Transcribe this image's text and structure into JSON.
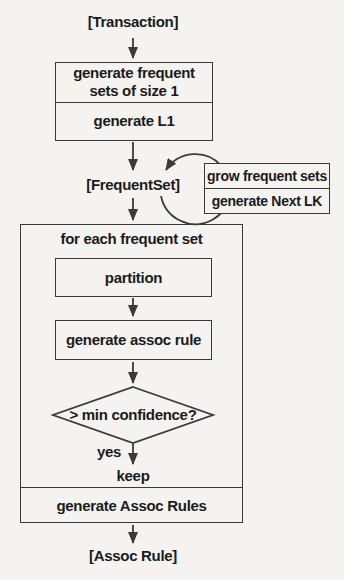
{
  "colors": {
    "background": "#f4f3f0",
    "ink": "#3a3a3a",
    "text": "#1b1b1b"
  },
  "nodes": {
    "transaction_label": "[Transaction]",
    "step1": {
      "line1": "generate frequent",
      "line2": "sets of size 1",
      "row2": "generate L1"
    },
    "frequentset_label": "[FrequentSet]",
    "loop_box": {
      "row1": "grow frequent sets",
      "row2": "generate Next LK"
    },
    "foreach": {
      "header": "for each frequent set",
      "footer": "generate Assoc Rules"
    },
    "partition_label": "partition",
    "generate_assoc_rule_label": "generate assoc rule",
    "decision_label": "> min confidence?",
    "yes_label": "yes",
    "keep_label": "keep",
    "assoc_rule_label": "[Assoc Rule]"
  }
}
